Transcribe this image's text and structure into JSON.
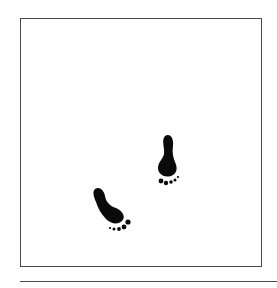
{
  "illustration": {
    "subject": "two footprints walking diagonally",
    "colors": {
      "ink": "#0a0a0a",
      "frame": "#4a4a4a",
      "background": "#ffffff"
    },
    "footprints": [
      {
        "name": "upper-footprint",
        "x": 168,
        "y": 135
      },
      {
        "name": "lower-footprint",
        "x": 97,
        "y": 188
      }
    ]
  }
}
